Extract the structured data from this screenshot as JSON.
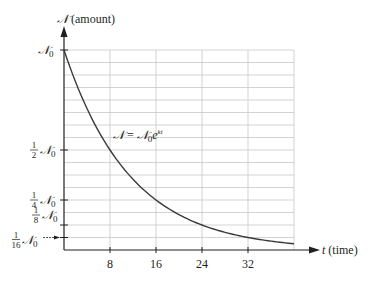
{
  "chart_data": {
    "type": "line",
    "title": "",
    "xlabel": "t (time)",
    "ylabel": "𝒩 (amount)",
    "x_var": "t",
    "x_unit": "(time)",
    "y_var": "𝒩",
    "y_unit": "(amount)",
    "equation": {
      "lhs": "𝒩",
      "eq": "=",
      "rhs_base": "𝒩",
      "rhs_sub": "0",
      "rhs_e": "e",
      "rhs_exp": "kt"
    },
    "xlim": [
      0,
      40
    ],
    "ylim": [
      0,
      1
    ],
    "x_ticks": [
      8,
      16,
      24,
      32
    ],
    "x_tick_labels": [
      "8",
      "16",
      "24",
      "32"
    ],
    "y_ticks": [
      {
        "value": 1,
        "label_num": "",
        "label_den": "",
        "label_sym": "𝒩",
        "label_sub": "0"
      },
      {
        "value": 0.5,
        "label_num": "1",
        "label_den": "2",
        "label_sym": "𝒩",
        "label_sub": "0"
      },
      {
        "value": 0.25,
        "label_num": "1",
        "label_den": "4",
        "label_sym": "𝒩",
        "label_sub": "0"
      },
      {
        "value": 0.125,
        "label_num": "1",
        "label_den": "8",
        "label_sym": "𝒩",
        "label_sub": "0"
      },
      {
        "value": 0.0625,
        "label_num": "1",
        "label_den": "16",
        "label_sym": "𝒩",
        "label_sub": "0"
      }
    ],
    "grid": {
      "horizontal_step": 0.0625,
      "vertical_at": [
        8,
        16,
        24,
        32,
        40
      ],
      "on": true
    },
    "series": [
      {
        "name": "𝒩 = 𝒩₀e^{kt}",
        "half_life": 8,
        "x": [
          0,
          4,
          8,
          12,
          16,
          20,
          24,
          28,
          32,
          36,
          40
        ],
        "values": [
          1,
          0.707,
          0.5,
          0.354,
          0.25,
          0.177,
          0.125,
          0.088,
          0.0625,
          0.044,
          0.031
        ]
      }
    ],
    "legend": "none"
  },
  "colors": {
    "axis": "#231f20",
    "grid": "#c8c8c8",
    "curve": "#3a3a3a"
  }
}
